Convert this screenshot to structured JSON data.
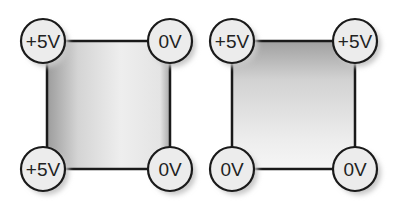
{
  "diagrams": [
    {
      "id": "left",
      "gradient": "horizontal",
      "square": {
        "x": 47,
        "y": 41,
        "w": 123,
        "h": 128
      },
      "nodes": [
        {
          "pos": "top-left",
          "label": "+5V",
          "cx": 43,
          "cy": 41
        },
        {
          "pos": "top-right",
          "label": "0V",
          "cx": 170,
          "cy": 41
        },
        {
          "pos": "bottom-left",
          "label": "+5V",
          "cx": 43,
          "cy": 169
        },
        {
          "pos": "bottom-right",
          "label": "0V",
          "cx": 170,
          "cy": 169
        }
      ]
    },
    {
      "id": "right",
      "gradient": "vertical",
      "square": {
        "x": 232,
        "y": 41,
        "w": 123,
        "h": 128
      },
      "nodes": [
        {
          "pos": "top-left",
          "label": "+5V",
          "cx": 232,
          "cy": 41
        },
        {
          "pos": "top-right",
          "label": "+5V",
          "cx": 355,
          "cy": 41
        },
        {
          "pos": "bottom-left",
          "label": "0V",
          "cx": 232,
          "cy": 169
        },
        {
          "pos": "bottom-right",
          "label": "0V",
          "cx": 355,
          "cy": 169
        }
      ]
    }
  ],
  "colors": {
    "stroke": "#1a1a1a",
    "node_fill": "#ececec",
    "shadow": "#c8c8c8",
    "gradient_dark": "#9a9a9a",
    "gradient_light": "#f2f2f2"
  }
}
